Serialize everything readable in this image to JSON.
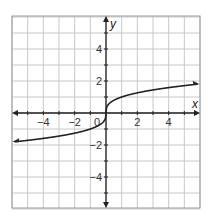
{
  "chart_data": {
    "type": "line",
    "title": "",
    "xlabel": "x",
    "ylabel": "y",
    "xlim": [
      -6,
      6
    ],
    "ylim": [
      -6,
      6
    ],
    "grid": true,
    "x_ticks": [
      -4,
      -2,
      0,
      2,
      4
    ],
    "y_ticks": [
      4,
      2,
      -2,
      -4
    ],
    "x_tick_labels": [
      "−4",
      "−2",
      "0",
      "2",
      "4"
    ],
    "y_tick_labels": [
      "4",
      "2",
      "−2",
      "−4"
    ],
    "origin_label": "0",
    "series": [
      {
        "name": "y = cbrt(x)",
        "x": [
          -6,
          -5,
          -4,
          -3,
          -2,
          -1,
          -0.5,
          -0.1,
          0,
          0.1,
          0.5,
          1,
          2,
          3,
          4,
          5,
          6
        ],
        "y": [
          -1.82,
          -1.71,
          -1.59,
          -1.44,
          -1.26,
          -1.0,
          -0.79,
          -0.46,
          0,
          0.46,
          0.79,
          1.0,
          1.26,
          1.44,
          1.59,
          1.71,
          1.82
        ],
        "arrows_both_ends": true
      }
    ]
  },
  "colors": {
    "grid": "#c8c8c8",
    "axis": "#222222",
    "curve": "#222222",
    "border": "#999999"
  }
}
